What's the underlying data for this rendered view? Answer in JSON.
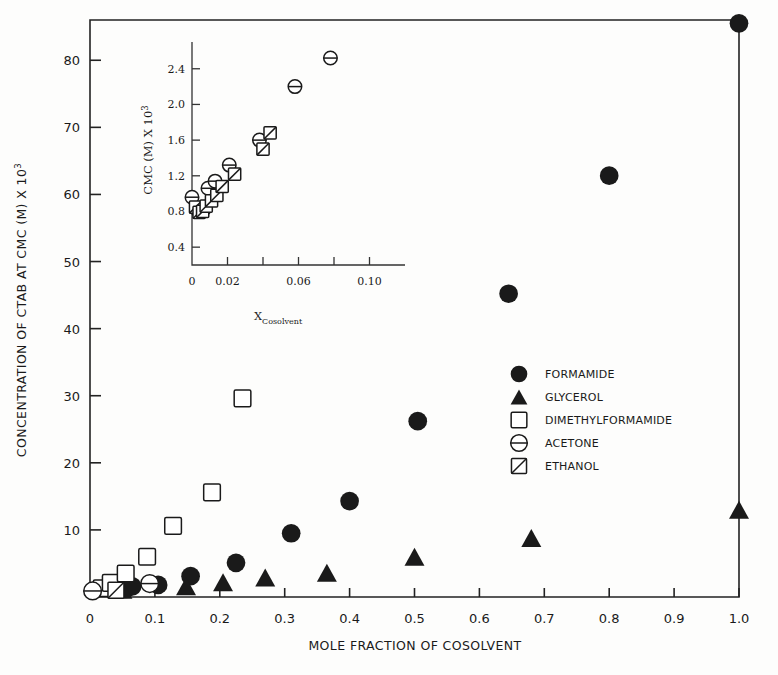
{
  "chart_data": {
    "type": "scatter",
    "title": "",
    "xlabel": "MOLE FRACTION OF COSOLVENT",
    "ylabel": "CONCENTRATION OF CTAB AT CMC (M) X 10",
    "ylabel_exponent": "3",
    "xlim": [
      0,
      1.0
    ],
    "ylim": [
      0,
      86
    ],
    "xticks": [
      0,
      0.1,
      0.2,
      0.3,
      0.4,
      0.5,
      0.6,
      0.7,
      0.8,
      0.9,
      1.0
    ],
    "xticklabels": [
      "0",
      "0.1",
      "0.2",
      "0.3",
      "0.4",
      "0.5",
      "0.6",
      "0.7",
      "0.8",
      "0.9",
      "1.0"
    ],
    "yticks": [
      10,
      20,
      30,
      40,
      50,
      60,
      70,
      80
    ],
    "yticklabels": [
      "10",
      "20",
      "30",
      "40",
      "50",
      "60",
      "70",
      "80"
    ],
    "grid": false,
    "legend_position": "center-right",
    "series": [
      {
        "name": "FORMAMIDE",
        "marker": "filled-circle",
        "points": [
          {
            "x": 0.055,
            "y": 1.2
          },
          {
            "x": 0.065,
            "y": 1.6
          },
          {
            "x": 0.105,
            "y": 1.8
          },
          {
            "x": 0.155,
            "y": 3.1
          },
          {
            "x": 0.225,
            "y": 5.1
          },
          {
            "x": 0.31,
            "y": 9.5
          },
          {
            "x": 0.4,
            "y": 14.3
          },
          {
            "x": 0.505,
            "y": 26.2
          },
          {
            "x": 0.645,
            "y": 45.2
          },
          {
            "x": 0.8,
            "y": 62.8
          },
          {
            "x": 1.0,
            "y": 85.5
          }
        ]
      },
      {
        "name": "GLYCEROL",
        "marker": "filled-triangle",
        "points": [
          {
            "x": 0.05,
            "y": 1.1
          },
          {
            "x": 0.148,
            "y": 1.6
          },
          {
            "x": 0.205,
            "y": 2.2
          },
          {
            "x": 0.27,
            "y": 2.9
          },
          {
            "x": 0.365,
            "y": 3.6
          },
          {
            "x": 0.5,
            "y": 6.0
          },
          {
            "x": 0.68,
            "y": 8.8
          },
          {
            "x": 1.0,
            "y": 13.0
          }
        ]
      },
      {
        "name": "DIMETHYLFORMAMIDE",
        "marker": "open-square",
        "points": [
          {
            "x": 0.018,
            "y": 1.3
          },
          {
            "x": 0.032,
            "y": 2.1
          },
          {
            "x": 0.055,
            "y": 3.5
          },
          {
            "x": 0.088,
            "y": 6.0
          },
          {
            "x": 0.128,
            "y": 10.6
          },
          {
            "x": 0.188,
            "y": 15.6
          },
          {
            "x": 0.235,
            "y": 29.6
          }
        ]
      },
      {
        "name": "ACETONE",
        "marker": "circle-hline",
        "points": [
          {
            "x": 0.004,
            "y": 0.9
          },
          {
            "x": 0.092,
            "y": 2.0
          }
        ]
      },
      {
        "name": "ETHANOL",
        "marker": "square-diag",
        "points": [
          {
            "x": 0.04,
            "y": 1.0
          }
        ]
      }
    ]
  },
  "inset_chart_data": {
    "type": "scatter",
    "title": "",
    "xlabel_base": "X",
    "xlabel_sub": "Cosolvent",
    "ylabel": "CMC (M) X 10",
    "ylabel_exponent": "3",
    "xlim": [
      0,
      0.12
    ],
    "ylim": [
      0.2,
      2.7
    ],
    "xticks": [
      0,
      0.02,
      0.04,
      0.06,
      0.08,
      0.1
    ],
    "xticklabels": [
      "0",
      "0.02",
      "",
      "0.06",
      "",
      "0.10"
    ],
    "yticks": [
      0.4,
      0.8,
      1.2,
      1.6,
      2.0,
      2.4
    ],
    "yticklabels": [
      "0.4",
      "0.8",
      "1.2",
      "1.6",
      "2.0",
      "2.4"
    ],
    "grid": false,
    "series": [
      {
        "name": "ACETONE",
        "marker": "circle-hline",
        "points": [
          {
            "x": 0.0,
            "y": 0.96
          },
          {
            "x": 0.003,
            "y": 0.82
          },
          {
            "x": 0.005,
            "y": 0.8
          },
          {
            "x": 0.007,
            "y": 0.83
          },
          {
            "x": 0.009,
            "y": 1.06
          },
          {
            "x": 0.013,
            "y": 1.14
          },
          {
            "x": 0.021,
            "y": 1.32
          },
          {
            "x": 0.038,
            "y": 1.6
          },
          {
            "x": 0.058,
            "y": 2.2
          },
          {
            "x": 0.078,
            "y": 2.52
          }
        ]
      },
      {
        "name": "ETHANOL",
        "marker": "square-diag",
        "points": [
          {
            "x": 0.002,
            "y": 0.85
          },
          {
            "x": 0.004,
            "y": 0.79
          },
          {
            "x": 0.006,
            "y": 0.8
          },
          {
            "x": 0.008,
            "y": 0.86
          },
          {
            "x": 0.011,
            "y": 0.92
          },
          {
            "x": 0.014,
            "y": 0.98
          },
          {
            "x": 0.017,
            "y": 1.08
          },
          {
            "x": 0.024,
            "y": 1.22
          },
          {
            "x": 0.04,
            "y": 1.5
          },
          {
            "x": 0.044,
            "y": 1.68
          }
        ]
      }
    ]
  },
  "legend": {
    "items": [
      {
        "label": "FORMAMIDE",
        "marker": "filled-circle"
      },
      {
        "label": "GLYCEROL",
        "marker": "filled-triangle"
      },
      {
        "label": "DIMETHYLFORMAMIDE",
        "marker": "open-square"
      },
      {
        "label": "ACETONE",
        "marker": "circle-hline"
      },
      {
        "label": "ETHANOL",
        "marker": "square-diag"
      }
    ]
  },
  "colors": {
    "ink": "#1a1a1a",
    "background": "#fdfdfc"
  }
}
